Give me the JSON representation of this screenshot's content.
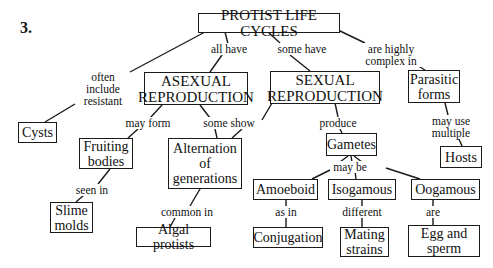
{
  "figure_number": "3.",
  "title": "PROTIST LIFE CYCLES",
  "nodes": {
    "root": "PROTIST LIFE CYCLES",
    "asexual": [
      "ASEXUAL",
      "REPRODUCTION"
    ],
    "sexual": [
      "SEXUAL",
      "REPRODUCTION"
    ],
    "parasitic": [
      "Parasitic",
      "forms"
    ],
    "cysts": "Cysts",
    "fruiting": [
      "Fruiting",
      "bodies"
    ],
    "alternation": [
      "Alternation",
      "of",
      "generations"
    ],
    "gametes": "Gametes",
    "hosts": "Hosts",
    "slime": [
      "Slime",
      "molds"
    ],
    "algal": "Algal protists",
    "amoeboid": "Amoeboid",
    "isogamous": "Isogamous",
    "oogamous": "Oogamous",
    "conjugation": "Conjugation",
    "mating": [
      "Mating",
      "strains"
    ],
    "egg": [
      "Egg and",
      "sperm"
    ]
  },
  "links": {
    "all_have": "all have",
    "some_have": "some have",
    "complex": [
      "are highly",
      "complex in"
    ],
    "resistant": [
      "often",
      "include",
      "resistant"
    ],
    "may_form": "may form",
    "some_show": "some show",
    "produce": "produce",
    "may_use": [
      "may use",
      "multiple"
    ],
    "seen_in": "seen in",
    "common_in": "common in",
    "may_be": "may be",
    "as_in": "as in",
    "different": "different",
    "are": "are"
  }
}
